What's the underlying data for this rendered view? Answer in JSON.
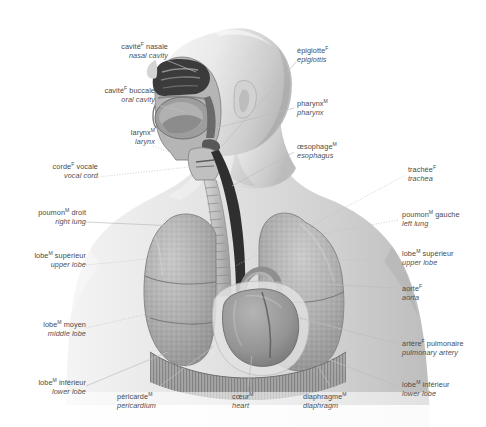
{
  "figure": {
    "background_color": "#ffffff",
    "text_color": "#4a4a4a",
    "line_color": "#b9b9b9",
    "style": "grayscale anatomical illustration, head in profile with sagittal cutaway, thorax with lungs, heart and diaphragm"
  },
  "labels": [
    {
      "id": "nasal-cavity",
      "fr": "cavité",
      "gender": "F",
      "fr_rest": " nasale",
      "en": "nasal cavity",
      "align": "right"
    },
    {
      "id": "oral-cavity",
      "fr": "cavité",
      "gender": "F",
      "fr_rest": " buccale",
      "en": "oral cavity",
      "align": "right"
    },
    {
      "id": "larynx",
      "fr": "larynx",
      "gender": "M",
      "fr_rest": "",
      "en": "larynx",
      "align": "right"
    },
    {
      "id": "vocal-cord",
      "fr": "corde",
      "gender": "F",
      "fr_rest": " vocale",
      "en": "vocal cord",
      "align": "right"
    },
    {
      "id": "right-lung",
      "fr": "poumon",
      "gender": "M",
      "fr_rest": " droit",
      "en": "right lung",
      "align": "right"
    },
    {
      "id": "right-upper-lobe",
      "fr": "lobe",
      "gender": "M",
      "fr_rest": " supérieur",
      "en": "upper lobe",
      "align": "right"
    },
    {
      "id": "middle-lobe",
      "fr": "lobe",
      "gender": "M",
      "fr_rest": " moyen",
      "en": "middle lobe",
      "align": "right"
    },
    {
      "id": "right-lower-lobe",
      "fr": "lobe",
      "gender": "M",
      "fr_rest": " inférieur",
      "en": "lower lobe",
      "align": "right"
    },
    {
      "id": "pericardium",
      "fr": "péricarde",
      "gender": "M",
      "fr_rest": "",
      "en": "pericardium",
      "align": "center"
    },
    {
      "id": "heart",
      "fr": "cœur",
      "gender": "M",
      "fr_rest": "",
      "en": "heart",
      "align": "center"
    },
    {
      "id": "diaphragm",
      "fr": "diaphragme",
      "gender": "M",
      "fr_rest": "",
      "en": "diaphragm",
      "align": "center"
    },
    {
      "id": "epiglottis",
      "fr": "épiglotte",
      "gender": "F",
      "fr_rest": "",
      "en": "epiglottis",
      "align": "left"
    },
    {
      "id": "pharynx",
      "fr": "pharynx",
      "gender": "M",
      "fr_rest": "",
      "en": "pharynx",
      "align": "left"
    },
    {
      "id": "esophagus",
      "fr": "œsophage",
      "gender": "M",
      "fr_rest": "",
      "en": "esophagus",
      "align": "left"
    },
    {
      "id": "trachea",
      "fr": "trachée",
      "gender": "F",
      "fr_rest": "",
      "en": "trachea",
      "align": "left"
    },
    {
      "id": "left-lung",
      "fr": "poumon",
      "gender": "M",
      "fr_rest": " gauche",
      "en": "left lung",
      "align": "left"
    },
    {
      "id": "left-upper-lobe",
      "fr": "lobe",
      "gender": "M",
      "fr_rest": " supérieur",
      "en": "upper lobe",
      "align": "left"
    },
    {
      "id": "aorta",
      "fr": "aorte",
      "gender": "F",
      "fr_rest": "",
      "en": "aorta",
      "align": "left"
    },
    {
      "id": "pulmonary-artery",
      "fr": "artère",
      "gender": "F",
      "fr_rest": " pulmonaire",
      "en": "pulmonary artery",
      "align": "left"
    },
    {
      "id": "left-lower-lobe",
      "fr": "lobe",
      "gender": "M",
      "fr_rest": " inférieur",
      "en": "lower lobe",
      "align": "left"
    }
  ]
}
